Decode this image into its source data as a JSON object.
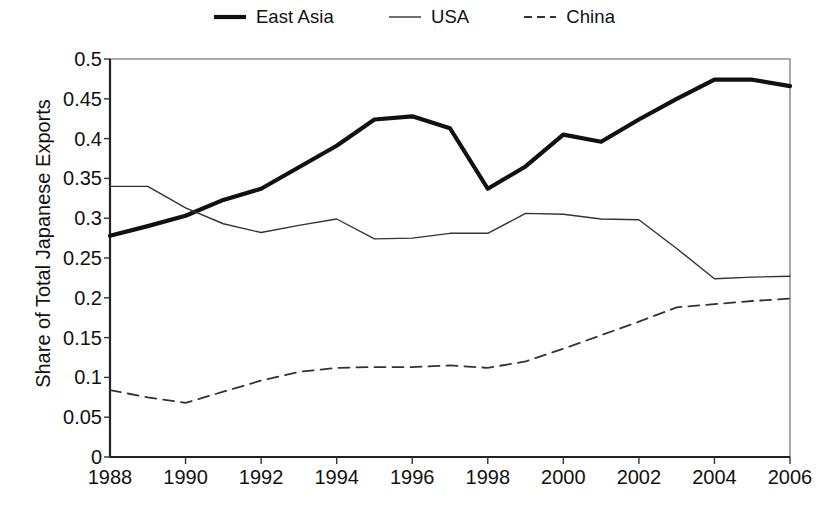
{
  "chart_data": {
    "type": "line",
    "title": "",
    "xlabel": "",
    "ylabel": "Share of Total Japanese Exports",
    "xlim": [
      1988,
      2006
    ],
    "ylim": [
      0,
      0.5
    ],
    "grid": false,
    "legend_position": "top-center",
    "x": [
      1988,
      1989,
      1990,
      1991,
      1992,
      1993,
      1994,
      1995,
      1996,
      1997,
      1998,
      1999,
      2000,
      2001,
      2002,
      2003,
      2004,
      2005,
      2006
    ],
    "xtick_labels": [
      "1988",
      "1990",
      "1992",
      "1994",
      "1996",
      "1998",
      "2000",
      "2002",
      "2004",
      "2006"
    ],
    "xtick_values": [
      1988,
      1990,
      1992,
      1994,
      1996,
      1998,
      2000,
      2002,
      2004,
      2006
    ],
    "ytick_labels": [
      "0",
      "0.05",
      "0.1",
      "0.15",
      "0.2",
      "0.25",
      "0.3",
      "0.35",
      "0.4",
      "0.45",
      "0.5"
    ],
    "ytick_values": [
      0,
      0.05,
      0.1,
      0.15,
      0.2,
      0.25,
      0.3,
      0.35,
      0.4,
      0.45,
      0.5
    ],
    "series": [
      {
        "name": "East Asia",
        "style": "solid",
        "width": 4.2,
        "color": "#111111",
        "values": [
          0.278,
          0.29,
          0.303,
          0.323,
          0.337,
          0.364,
          0.391,
          0.424,
          0.428,
          0.413,
          0.337,
          0.365,
          0.405,
          0.396,
          0.424,
          0.45,
          0.474,
          0.474,
          0.466
        ]
      },
      {
        "name": "USA",
        "style": "solid",
        "width": 1.4,
        "color": "#333333",
        "values": [
          0.34,
          0.34,
          0.313,
          0.293,
          0.282,
          0.291,
          0.299,
          0.274,
          0.275,
          0.281,
          0.281,
          0.306,
          0.305,
          0.299,
          0.298,
          0.262,
          0.224,
          0.226,
          0.227
        ]
      },
      {
        "name": "China",
        "style": "dashed",
        "width": 1.8,
        "color": "#333333",
        "values": [
          0.084,
          0.075,
          0.068,
          0.082,
          0.096,
          0.107,
          0.112,
          0.113,
          0.113,
          0.115,
          0.112,
          0.12,
          0.136,
          0.153,
          0.17,
          0.188,
          0.192,
          0.196,
          0.199
        ]
      }
    ]
  }
}
